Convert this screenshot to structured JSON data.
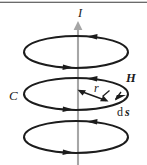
{
  "figure": {
    "name": "amperes-law-circulation-diagram",
    "caption": "Magnetic field H circulating in closed loops C of radius r around a current I, with line element ds",
    "width": 147,
    "height": 165,
    "background": "#ffffff",
    "ink_color": "#1c1c1c",
    "axis_color": "#a6a6a6",
    "rule_color": "#3a3a3a"
  },
  "labels": {
    "current": "I",
    "contour": "C",
    "field": "H",
    "radius": "r",
    "element_d": "d",
    "element_s": "s"
  },
  "geometry": {
    "axis": {
      "x": 78,
      "y_top": 22,
      "y_bottom": 165
    },
    "loops": [
      {
        "cx": 76,
        "cy": 52,
        "rx": 52,
        "ry": 16
      },
      {
        "cx": 76,
        "cy": 94,
        "rx": 52,
        "ry": 16
      },
      {
        "cx": 76,
        "cy": 137,
        "rx": 52,
        "ry": 16
      }
    ],
    "radius_arrow": {
      "x1": 78,
      "y1": 90,
      "x2": 108,
      "y2": 101
    },
    "ds_ticks": [
      106,
      119
    ]
  },
  "label_positions": {
    "current": {
      "x": 80,
      "y": 17
    },
    "contour": {
      "x": 9,
      "y": 100
    },
    "field": {
      "x": 126,
      "y": 82
    },
    "radius": {
      "x": 94,
      "y": 92
    },
    "element": {
      "x": 118,
      "y": 115
    }
  }
}
